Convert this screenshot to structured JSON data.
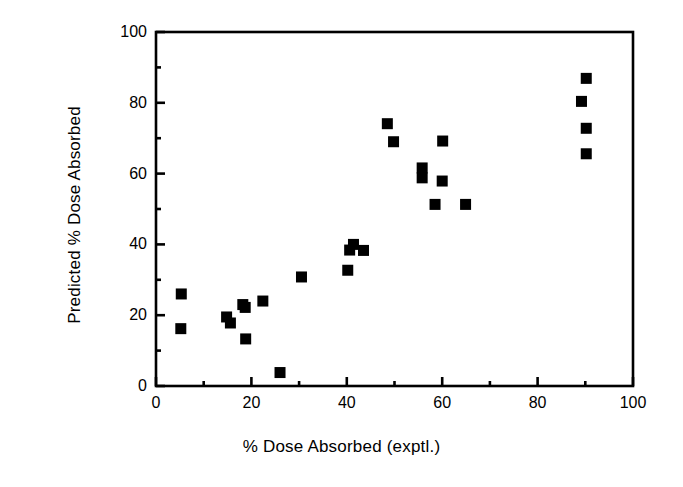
{
  "chart_data": {
    "type": "scatter",
    "title": "",
    "xlabel": "% Dose Absorbed (exptl.)",
    "ylabel": "Predicted % Dose Absorbed",
    "xlim": [
      0,
      100
    ],
    "ylim": [
      0,
      100
    ],
    "xticks": [
      0,
      20,
      40,
      60,
      80,
      100
    ],
    "yticks": [
      0,
      20,
      40,
      60,
      80,
      100
    ],
    "xminorticks": [
      10,
      30,
      50,
      70,
      90
    ],
    "yminorticks": [
      10,
      30,
      50,
      70,
      90
    ],
    "xticklabels": [
      "0",
      "20",
      "40",
      "60",
      "80",
      "100"
    ],
    "yticklabels": [
      "0",
      "20",
      "40",
      "60",
      "80",
      "100"
    ],
    "grid": false,
    "legend": false,
    "marker": "square",
    "marker_color": "#000000",
    "marker_size": 11,
    "frame_color": "#000000",
    "background": "#ffffff",
    "series": [
      {
        "name": "compounds",
        "points": [
          {
            "x": 5.3,
            "y": 26.0
          },
          {
            "x": 5.2,
            "y": 16.2
          },
          {
            "x": 14.8,
            "y": 19.5
          },
          {
            "x": 15.6,
            "y": 17.8
          },
          {
            "x": 18.2,
            "y": 23.0
          },
          {
            "x": 18.7,
            "y": 22.2
          },
          {
            "x": 18.8,
            "y": 13.3
          },
          {
            "x": 22.4,
            "y": 24.0
          },
          {
            "x": 26.0,
            "y": 3.8
          },
          {
            "x": 30.5,
            "y": 30.8
          },
          {
            "x": 40.2,
            "y": 32.7
          },
          {
            "x": 40.6,
            "y": 38.4
          },
          {
            "x": 41.4,
            "y": 40.0
          },
          {
            "x": 43.5,
            "y": 38.3
          },
          {
            "x": 48.5,
            "y": 74.1
          },
          {
            "x": 49.8,
            "y": 69.0
          },
          {
            "x": 55.8,
            "y": 61.6
          },
          {
            "x": 55.8,
            "y": 58.8
          },
          {
            "x": 58.5,
            "y": 51.3
          },
          {
            "x": 60.0,
            "y": 57.9
          },
          {
            "x": 60.1,
            "y": 69.2
          },
          {
            "x": 64.9,
            "y": 51.3
          },
          {
            "x": 90.2,
            "y": 86.9
          },
          {
            "x": 89.2,
            "y": 80.4
          },
          {
            "x": 90.2,
            "y": 72.8
          },
          {
            "x": 90.2,
            "y": 65.6
          }
        ]
      }
    ]
  }
}
